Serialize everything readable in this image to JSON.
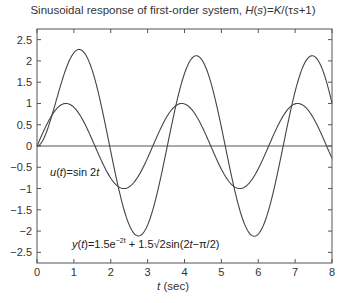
{
  "chart_data": {
    "type": "line",
    "title": "Sinusoidal response of first-order system, H(s)=K/(τs+1)",
    "title_parts": {
      "prefix": "Sinusoidal response of first-order system, ",
      "H": "H",
      "s": "s",
      "eq": "=",
      "K": "K",
      "rest": "/(τ",
      "s2": "s",
      "tail": "+1)"
    },
    "xlabel": "t (sec)",
    "xlabel_parts": {
      "var": "t",
      "unit": " (sec)"
    },
    "ylabel": "",
    "xlim": [
      0,
      8
    ],
    "ylim": [
      -2.75,
      2.75
    ],
    "xticks": [
      0,
      1,
      2,
      3,
      4,
      5,
      6,
      7,
      8
    ],
    "xtick_labels": [
      "0",
      "1",
      "2",
      "3",
      "4",
      "5",
      "6",
      "7",
      "8"
    ],
    "yticks": [
      2.5,
      2,
      1.5,
      1,
      0.5,
      0,
      -0.5,
      -1,
      -1.5,
      -2,
      -2.5
    ],
    "ytick_labels": [
      "2.5",
      "2",
      "1.5",
      "1",
      "0.5",
      "0",
      "−0.5",
      "−1",
      "−1.5",
      "−2",
      "−2.5"
    ],
    "grid": false,
    "zero_line": true,
    "series": [
      {
        "name": "u(t)=sin 2t",
        "x": [
          0,
          0.25,
          0.5,
          0.785,
          1.0,
          1.25,
          1.5,
          1.75,
          2.0,
          2.356,
          2.5,
          2.75,
          3.0,
          3.14,
          3.5,
          3.93,
          4.25,
          4.5,
          4.75,
          5.0,
          5.5,
          5.5,
          6.0,
          6.28,
          6.5,
          7.07,
          7.5,
          8.0
        ],
        "values": [
          0,
          0.48,
          0.84,
          1.0,
          0.91,
          0.6,
          0.14,
          -0.35,
          -0.76,
          -1.0,
          -0.96,
          -0.71,
          -0.28,
          0,
          0.66,
          1.0,
          0.8,
          0.41,
          -0.07,
          -0.54,
          -1.0,
          -1.0,
          -0.54,
          0,
          0.42,
          1.0,
          0.65,
          -0.29
        ]
      },
      {
        "name": "y(t)=1.5e^-2t + 1.5√2sin(2t−π/2)",
        "x": [
          0,
          0.25,
          0.5,
          0.75,
          1.0,
          1.18,
          1.5,
          1.75,
          2.0,
          2.25,
          2.5,
          2.75,
          3.0,
          3.5,
          4.0,
          4.32,
          4.75,
          5.0,
          5.5,
          5.89,
          6.5,
          7.0,
          7.46,
          8.0
        ],
        "values": [
          0,
          0.76,
          1.43,
          1.93,
          2.21,
          2.26,
          2.07,
          1.57,
          0.89,
          0.1,
          -0.69,
          -1.35,
          -1.8,
          -2.1,
          -1.2,
          2.12,
          1.3,
          0.65,
          -1.08,
          -2.12,
          -1.22,
          0.86,
          2.12,
          0.85
        ]
      }
    ],
    "annotations": [
      {
        "text": "u(t)=sin 2t",
        "x": 0.35,
        "y": -0.65
      },
      {
        "text": "y(t)=1.5e^-2t + 1.5√2sin(2t−π/2)",
        "x": 1.0,
        "y": -2.25
      }
    ],
    "model": {
      "u": {
        "amp": 1,
        "omega": 2,
        "phase": 0
      },
      "y": {
        "trans_amp": 1.5,
        "trans_rate": -2,
        "ss_amp": 2.1213,
        "omega": 2,
        "phase": -0.7854
      }
    },
    "layout": {
      "left": 37,
      "right": 332,
      "top": 29,
      "bottom": 263
    },
    "colors": {
      "line": "#444444",
      "axis": "#555555",
      "text": "#333333"
    }
  },
  "annotations_text": {
    "u": {
      "var": "u",
      "arg": "t",
      "rest": "=sin 2",
      "t": "t"
    },
    "y": {
      "var": "y",
      "arg": "t",
      "eq": "=1.5e",
      "exp": "−2t",
      "rest": " + 1.5√2sin(2",
      "t": "t",
      "tail": "−π/2)"
    }
  }
}
